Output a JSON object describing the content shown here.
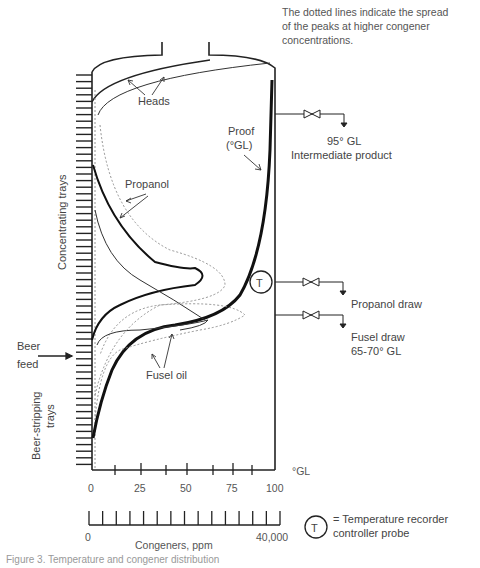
{
  "note": {
    "line1": "The dotted lines indicate the spread",
    "line2": "of the peaks at higher congener",
    "line3": "concentrations."
  },
  "curve_labels": {
    "heads": "Heads",
    "proof_line1": "Proof",
    "proof_line2": "(°GL)",
    "propanol": "Propanol",
    "fusel_oil": "Fusel oil"
  },
  "side_labels": {
    "concentrating_trays": "Concentrating trays",
    "beer_stripping_line1": "Beer-stripping",
    "beer_stripping_line2": "trays",
    "beer_feed_line1": "Beer",
    "beer_feed_line2": "feed"
  },
  "outlets": [
    {
      "line1": "95° GL",
      "line2": "Intermediate product"
    },
    {
      "line1": "Propanol draw",
      "line2": ""
    },
    {
      "line1": "Fusel draw",
      "line2": "65-70° GL"
    }
  ],
  "probe": {
    "symbol": "T",
    "legend_line1": "= Temperature recorder",
    "legend_line2": "controller probe"
  },
  "axes": {
    "proof_axis": {
      "unit": "°GL",
      "ticks": [
        "0",
        "25",
        "50",
        "75",
        "100"
      ]
    },
    "congener_axis": {
      "label": "Congeners, ppm",
      "min": "0",
      "max": "40,000"
    }
  },
  "caption": "Figure 3. Temperature and congener distribution"
}
